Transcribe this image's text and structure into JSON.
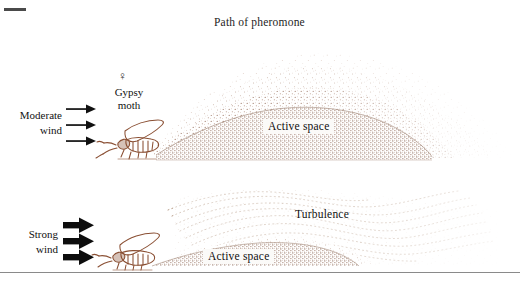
{
  "figure": {
    "title": "Path of pheromone",
    "background_color": "#ffffff",
    "plume_color": "#9c7a68",
    "moth_line_color": "#8a4f33",
    "arrow_color": "#111111",
    "rule_color": "#8a8a8a"
  },
  "panels": [
    {
      "id": "moderate-wind-panel",
      "wind_label_line1": "Moderate",
      "wind_label_line2": "wind",
      "wind_strength": "moderate",
      "arrow_count": 3,
      "insect_label_line1": "Gypsy",
      "insect_label_line2": "moth",
      "insect_sex_symbol": "♀",
      "active_space_label": "Active space"
    },
    {
      "id": "strong-wind-panel",
      "wind_label_line1": "Strong",
      "wind_label_line2": "wind",
      "wind_strength": "strong",
      "arrow_count": 3,
      "active_space_label": "Active space",
      "turbulence_label": "Turbulence"
    }
  ]
}
